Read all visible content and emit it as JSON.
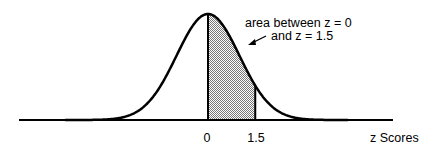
{
  "chart_data": {
    "type": "area",
    "title": "",
    "xlabel": "z Scores",
    "ylabel": "",
    "distribution": "standard normal",
    "x_ticks": [
      {
        "value": 0,
        "label": "0"
      },
      {
        "value": 1.5,
        "label": "1.5"
      }
    ],
    "shaded_region": {
      "from": 0,
      "to": 1.5
    },
    "annotation": {
      "line1": "area between z = 0",
      "line2": "and z = 1.5"
    },
    "x_range": [
      -3,
      3
    ]
  },
  "labels": {
    "tick_0": "0",
    "tick_1_5": "1.5",
    "axis_label": "z Scores",
    "annotation_line1": "area between z = 0",
    "annotation_line2": "and z = 1.5"
  },
  "colors": {
    "line": "#000000",
    "shade": "#b8b8b8",
    "background": "#ffffff"
  }
}
